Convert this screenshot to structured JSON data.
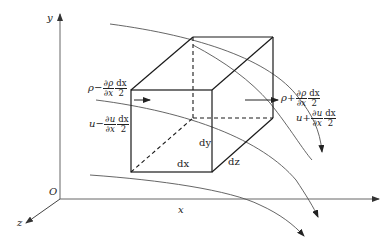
{
  "diagram": {
    "type": "3d-control-volume",
    "axes": {
      "x_label": "x",
      "y_label": "y",
      "z_label": "z",
      "origin_label": "O"
    },
    "box": {
      "edge_x_label": "dx",
      "edge_y_label": "dy",
      "edge_z_label": "dz"
    },
    "left_face": {
      "density": {
        "base": "ρ",
        "sign": "−",
        "num": "∂ρ",
        "den": "∂x",
        "num2": "dx",
        "den2": "2"
      },
      "velocity": {
        "base": "u",
        "sign": "−",
        "num": "∂u",
        "den": "∂x",
        "num2": "dx",
        "den2": "2"
      }
    },
    "right_face": {
      "density": {
        "base": "ρ",
        "sign": "+",
        "num": "∂ρ",
        "den": "∂x",
        "num2": "dx",
        "den2": "2"
      },
      "velocity": {
        "base": "u",
        "sign": "+",
        "num": "∂u",
        "den": "∂x",
        "num2": "dx",
        "den2": "2"
      }
    },
    "colors": {
      "box_line": "#1a1a1a",
      "axis_line": "#555555",
      "streamline": "#444444"
    }
  }
}
